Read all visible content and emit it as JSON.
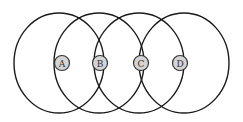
{
  "diagram": {
    "type": "overlapping-circles",
    "colors": {
      "stroke": "#1a1a1a",
      "badge_fill": "#d4d4d4",
      "badge_stroke": "#333333",
      "label": "#333333",
      "background": "#ffffff"
    },
    "nodes": [
      {
        "label": "A",
        "cx": 62,
        "cy": 63
      },
      {
        "label": "B",
        "cx": 100,
        "cy": 63
      },
      {
        "label": "C",
        "cx": 141,
        "cy": 63
      },
      {
        "label": "D",
        "cx": 180,
        "cy": 63
      }
    ]
  }
}
